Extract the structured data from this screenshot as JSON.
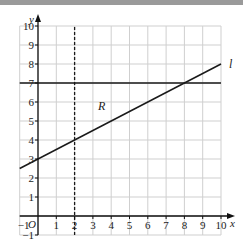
{
  "chart_data": {
    "type": "line",
    "title": "",
    "xlabel": "x",
    "ylabel": "y",
    "origin_label": "O",
    "xlim": [
      -1,
      10
    ],
    "ylim": [
      -1,
      10
    ],
    "grid": true,
    "x_ticks": [
      "-1",
      "1",
      "2",
      "3",
      "4",
      "5",
      "6",
      "7",
      "8",
      "9",
      "10"
    ],
    "y_ticks": [
      "-1",
      "1",
      "2",
      "3",
      "4",
      "5",
      "6",
      "7",
      "8",
      "9",
      "10"
    ],
    "series": [
      {
        "name": "l",
        "style": "solid",
        "x": [
          -1,
          10
        ],
        "y": [
          2.5,
          8
        ],
        "equation": "y = 0.5x + 3"
      },
      {
        "name": "y = 7",
        "style": "solid",
        "x": [
          -1,
          10
        ],
        "y": [
          7,
          7
        ]
      },
      {
        "name": "x = 2",
        "style": "dashed",
        "x": [
          2,
          2
        ],
        "y": [
          -1,
          10
        ]
      }
    ],
    "annotations": [
      {
        "text": "R",
        "x": 3.5,
        "y": 5.8
      },
      {
        "text": "l",
        "x": 10.4,
        "y": 8
      }
    ]
  },
  "labels": {
    "x_axis": "x",
    "y_axis": "y",
    "origin": "O",
    "line_l": "l",
    "region": "R",
    "x_ticks": [
      "1",
      "2",
      "3",
      "4",
      "5",
      "6",
      "7",
      "8",
      "9",
      "10"
    ],
    "y_ticks": [
      "1",
      "2",
      "3",
      "4",
      "5",
      "6",
      "7",
      "8",
      "9",
      "10"
    ],
    "x_neg": "−1",
    "y_neg": "−1"
  }
}
